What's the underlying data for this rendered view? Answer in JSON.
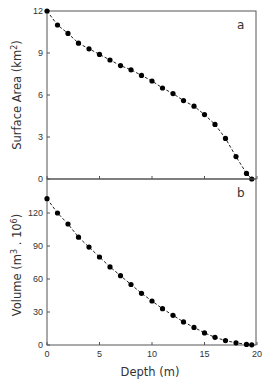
{
  "chart_data": [
    {
      "panel": "a",
      "type": "line",
      "title": "",
      "xlabel": "Depth (m)",
      "ylabel": "Surface Area (km2)",
      "ylabel_parts": {
        "main": "Surface Area (km",
        "sup": "2",
        "end": ")"
      },
      "xlim": [
        0,
        20
      ],
      "ylim": [
        0,
        12
      ],
      "yticks": [
        0,
        3,
        6,
        9,
        12
      ],
      "xticks": [
        0,
        5,
        10,
        15,
        20
      ],
      "grid": false,
      "marker": "filled-circle",
      "line_style": "dashed",
      "x": [
        0,
        1,
        2,
        3,
        4,
        5,
        6,
        7,
        8,
        9,
        10,
        11,
        12,
        13,
        14,
        15,
        16,
        17,
        18,
        19,
        19.5
      ],
      "values": [
        12.0,
        11.0,
        10.4,
        9.7,
        9.3,
        8.9,
        8.5,
        8.1,
        7.8,
        7.4,
        7.0,
        6.5,
        6.1,
        5.6,
        5.2,
        4.6,
        3.9,
        2.9,
        1.6,
        0.4,
        0.0
      ]
    },
    {
      "panel": "b",
      "type": "line",
      "title": "",
      "xlabel": "Depth (m)",
      "ylabel": "Volume (m3 . 106)",
      "ylabel_parts": {
        "main": "Volume (m",
        "sup": "3",
        "mid": " . 10",
        "sup2": "6",
        "end": ")"
      },
      "xlim": [
        0,
        20
      ],
      "ylim": [
        0,
        135
      ],
      "yticks": [
        0,
        30,
        60,
        90,
        120
      ],
      "xticks": [
        0,
        5,
        10,
        15,
        20
      ],
      "grid": false,
      "marker": "filled-circle",
      "line_style": "dashed",
      "x": [
        0,
        1,
        2,
        3,
        4,
        5,
        6,
        7,
        8,
        9,
        10,
        11,
        12,
        13,
        14,
        15,
        16,
        17,
        18,
        19,
        19.5
      ],
      "values": [
        133,
        120,
        110,
        98,
        89,
        80,
        71,
        63,
        55,
        47,
        40,
        33,
        27,
        21,
        16,
        11,
        7,
        4,
        2,
        0.5,
        0.2
      ]
    }
  ],
  "labels": {
    "panel_a": "a",
    "panel_b": "b",
    "xlabel": "Depth (m)"
  },
  "colors": {
    "axis": "#555555",
    "marker": "#000000",
    "text": "#333333"
  }
}
